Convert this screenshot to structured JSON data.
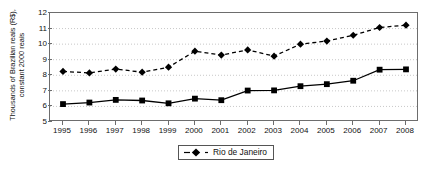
{
  "chart_data": {
    "type": "line",
    "title": "",
    "xlabel": "",
    "ylabel_line1": "Thousands of Brazilian reais (R$),",
    "ylabel_line2": "constant 2000 reais",
    "categories": [
      "1995",
      "1996",
      "1997",
      "1998",
      "1999",
      "2000",
      "2001",
      "2002",
      "2003",
      "2004",
      "2005",
      "2006",
      "2007",
      "2008"
    ],
    "xlim": [
      1995,
      2008
    ],
    "ylim": [
      5,
      12
    ],
    "yticks": [
      "5",
      "6",
      "7",
      "8",
      "9",
      "10",
      "11",
      "12"
    ],
    "grid": "horizontal-dotted",
    "legend_position": "bottom-center",
    "series": [
      {
        "name": "Rio de Janeiro",
        "marker": "diamond",
        "linestyle": "dashed",
        "color": "#000000",
        "values": [
          8.25,
          8.15,
          8.4,
          8.2,
          8.52,
          9.55,
          9.3,
          9.63,
          9.23,
          10.0,
          10.2,
          10.57,
          11.07,
          11.22
        ]
      },
      {
        "name": "",
        "marker": "square",
        "linestyle": "solid",
        "color": "#000000",
        "values": [
          6.15,
          6.25,
          6.42,
          6.38,
          6.2,
          6.5,
          6.4,
          7.02,
          7.03,
          7.3,
          7.43,
          7.65,
          8.36,
          8.38
        ]
      }
    ]
  },
  "legend": {
    "entries": [
      {
        "label": "Rio de Janeiro",
        "marker": "diamond",
        "linestyle": "dashed"
      }
    ]
  },
  "colors": {
    "axis": "#6d6d6d",
    "grid": "#c8c8c8",
    "series": "#000000",
    "text": "#111111",
    "background": "#ffffff"
  }
}
